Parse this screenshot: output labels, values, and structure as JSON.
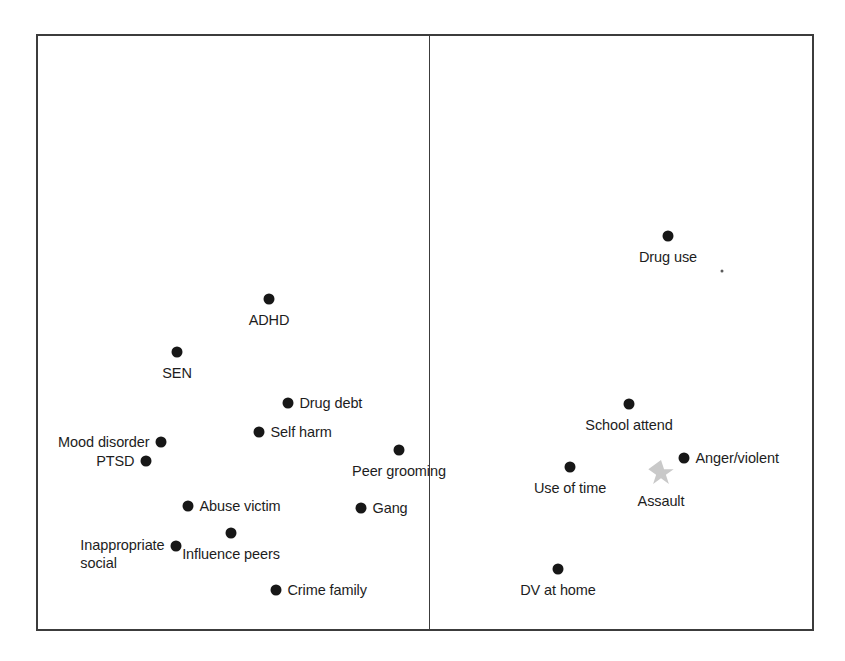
{
  "figure": {
    "title": "",
    "panel_left_name": "left-panel",
    "panel_right_name": "right-panel",
    "marker_color": "#171717",
    "star_color": "#c9c9c9",
    "frame_color": "#3c3c3c",
    "background": "#ffffff"
  },
  "chart_data": {
    "type": "scatter",
    "title": "",
    "subtitle": "",
    "xlabel": "",
    "ylabel": "",
    "grid": false,
    "legend": false,
    "axis_ticks": false,
    "panel_count": 2,
    "xlim": [
      0,
      100
    ],
    "ylim": [
      0,
      100
    ],
    "panels": [
      {
        "name": "left-panel",
        "label": "",
        "points": [
          {
            "label": "ADHD",
            "x": 269,
            "y": 299,
            "marker": "circle",
            "color": "#171717",
            "label_pos": "below"
          },
          {
            "label": "SEN",
            "x": 177,
            "y": 352,
            "marker": "circle",
            "color": "#171717",
            "label_pos": "below"
          },
          {
            "label": "Drug debt",
            "x": 288,
            "y": 403,
            "marker": "circle",
            "color": "#171717",
            "label_pos": "right"
          },
          {
            "label": "Self harm",
            "x": 259,
            "y": 432,
            "marker": "circle",
            "color": "#171717",
            "label_pos": "right"
          },
          {
            "label": "Mood disorder",
            "x": 161,
            "y": 442,
            "marker": "circle",
            "color": "#171717",
            "label_pos": "left"
          },
          {
            "label": "PTSD",
            "x": 146,
            "y": 461,
            "marker": "circle",
            "color": "#171717",
            "label_pos": "left"
          },
          {
            "label": "Peer grooming",
            "x": 399,
            "y": 450,
            "marker": "circle",
            "color": "#171717",
            "label_pos": "below"
          },
          {
            "label": "Abuse victim",
            "x": 188,
            "y": 506,
            "marker": "circle",
            "color": "#171717",
            "label_pos": "right"
          },
          {
            "label": "Gang",
            "x": 361,
            "y": 508,
            "marker": "circle",
            "color": "#171717",
            "label_pos": "right"
          },
          {
            "label": "Influence peers",
            "x": 231,
            "y": 533,
            "marker": "circle",
            "color": "#171717",
            "label_pos": "below"
          },
          {
            "label": "Inappropriate\nsocial",
            "x": 176,
            "y": 546,
            "marker": "circle",
            "color": "#171717",
            "label_pos": "left"
          },
          {
            "label": "Crime family",
            "x": 276,
            "y": 590,
            "marker": "circle",
            "color": "#171717",
            "label_pos": "right"
          }
        ]
      },
      {
        "name": "right-panel",
        "label": "",
        "points": [
          {
            "label": "Drug use",
            "x": 668,
            "y": 236,
            "marker": "circle",
            "color": "#171717",
            "label_pos": "below"
          },
          {
            "label": "",
            "x": 722,
            "y": 271,
            "marker": "speck",
            "color": "#5b5b5b",
            "label_pos": "none"
          },
          {
            "label": "School attend",
            "x": 629,
            "y": 404,
            "marker": "circle",
            "color": "#171717",
            "label_pos": "below"
          },
          {
            "label": "Anger/violent",
            "x": 684,
            "y": 458,
            "marker": "circle",
            "color": "#171717",
            "label_pos": "right"
          },
          {
            "label": "Use of time",
            "x": 570,
            "y": 467,
            "marker": "circle",
            "color": "#171717",
            "label_pos": "below"
          },
          {
            "label": "Assault",
            "x": 661,
            "y": 473,
            "marker": "star",
            "color": "#c9c9c9",
            "label_pos": "below"
          },
          {
            "label": "DV at home",
            "x": 558,
            "y": 569,
            "marker": "circle",
            "color": "#171717",
            "label_pos": "below"
          }
        ]
      }
    ]
  }
}
